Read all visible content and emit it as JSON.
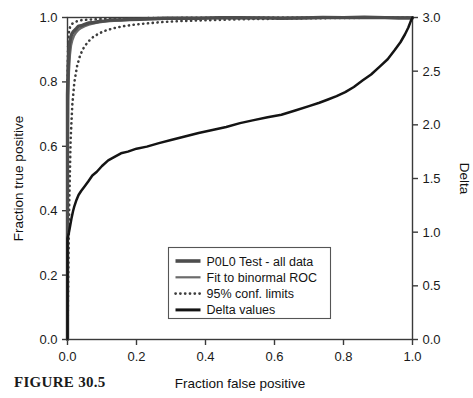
{
  "figure": {
    "caption": "FIGURE 30.5"
  },
  "chart_data": {
    "type": "line",
    "title": "",
    "xlabel": "Fraction false positive",
    "ylabel": "Fraction true positive",
    "y2label": "Delta",
    "xlim": [
      0.0,
      1.0
    ],
    "ylim": [
      0.0,
      1.0
    ],
    "y2lim": [
      0.0,
      3.0
    ],
    "grid": false,
    "legend_position": "lower center",
    "xticks": [
      "0.0",
      "0.2",
      "0.4",
      "0.6",
      "0.8",
      "1.0"
    ],
    "xtick_values": [
      0.0,
      0.2,
      0.4,
      0.6,
      0.8,
      1.0
    ],
    "yticks": [
      "0.0",
      "0.2",
      "0.4",
      "0.6",
      "0.8",
      "1.0"
    ],
    "ytick_values": [
      0.0,
      0.2,
      0.4,
      0.6,
      0.8,
      1.0
    ],
    "y2ticks": [
      "0.0",
      "0.5",
      "1.0",
      "1.5",
      "2.0",
      "2.5",
      "3.0"
    ],
    "y2tick_values": [
      0.0,
      0.5,
      1.0,
      1.5,
      2.0,
      2.5,
      3.0
    ],
    "colors": {
      "empirical_roc": "#4d4d4d",
      "binormal_fit": "#6b6b6b",
      "conf_limits": "#3d3d3d",
      "delta": "#141414",
      "axis": "#3a3a3a"
    },
    "series": [
      {
        "name": "P0L0 Test - all data",
        "style": "solid-thick",
        "axis": "left",
        "x": [
          0.0,
          0.0,
          0.0,
          0.0,
          0.002,
          0.004,
          0.006,
          0.009,
          0.012,
          0.016,
          0.021,
          0.026,
          0.032,
          0.04,
          0.05,
          0.062,
          0.076,
          0.092,
          0.11,
          0.13,
          0.155,
          0.18,
          0.21,
          0.245,
          0.285,
          0.33,
          0.38,
          0.44,
          0.5,
          0.56,
          0.62,
          0.68,
          0.74,
          0.8,
          0.86,
          0.92,
          0.96,
          1.0
        ],
        "y": [
          0.0,
          0.3,
          0.56,
          0.76,
          0.85,
          0.895,
          0.92,
          0.936,
          0.947,
          0.955,
          0.962,
          0.967,
          0.972,
          0.976,
          0.98,
          0.983,
          0.986,
          0.988,
          0.99,
          0.992,
          0.993,
          0.994,
          0.995,
          0.996,
          0.9965,
          0.997,
          0.9975,
          0.998,
          0.9982,
          0.9985,
          0.9988,
          0.999,
          0.9992,
          0.9994,
          0.9996,
          0.9998,
          0.9999,
          1.0
        ]
      },
      {
        "name": "Fit to binormal ROC",
        "style": "solid",
        "axis": "left",
        "x": [
          0.0,
          0.0,
          0.001,
          0.002,
          0.004,
          0.007,
          0.01,
          0.014,
          0.019,
          0.025,
          0.032,
          0.04,
          0.05,
          0.062,
          0.076,
          0.092,
          0.112,
          0.135,
          0.162,
          0.195,
          0.232,
          0.275,
          0.325,
          0.385,
          0.45,
          0.52,
          0.595,
          0.672,
          0.75,
          0.83,
          0.905,
          0.96,
          1.0
        ],
        "y": [
          0.0,
          0.32,
          0.6,
          0.74,
          0.83,
          0.885,
          0.912,
          0.93,
          0.944,
          0.954,
          0.962,
          0.968,
          0.973,
          0.978,
          0.982,
          0.985,
          0.988,
          0.99,
          0.992,
          0.994,
          0.995,
          0.996,
          0.997,
          0.9975,
          0.998,
          0.9985,
          0.999,
          0.9992,
          0.9995,
          0.9997,
          0.9998,
          0.9999,
          1.0
        ]
      },
      {
        "name": "95% conf. limits",
        "style": "dotted",
        "axis": "left",
        "lower": {
          "x": [
            0.0,
            0.002,
            0.005,
            0.009,
            0.014,
            0.02,
            0.028,
            0.037,
            0.048,
            0.06,
            0.075,
            0.092,
            0.112,
            0.135,
            0.162,
            0.195,
            0.232,
            0.275,
            0.325,
            0.385,
            0.45,
            0.52,
            0.6,
            0.69,
            0.79,
            0.89,
            1.0
          ],
          "y": [
            0.0,
            0.17,
            0.42,
            0.62,
            0.73,
            0.8,
            0.85,
            0.884,
            0.908,
            0.925,
            0.94,
            0.951,
            0.96,
            0.967,
            0.973,
            0.978,
            0.982,
            0.986,
            0.989,
            0.991,
            0.993,
            0.995,
            0.996,
            0.9975,
            0.9985,
            0.9993,
            1.0
          ]
        },
        "upper": {
          "x": [
            0.0,
            0.0,
            0.0,
            0.001,
            0.002,
            0.004,
            0.006,
            0.009,
            0.013,
            0.018,
            0.024,
            0.032,
            0.042,
            0.055,
            0.07,
            0.09,
            0.115,
            0.145,
            0.185,
            0.235,
            0.3,
            0.38,
            0.48,
            0.6,
            0.74,
            0.88,
            1.0
          ],
          "y": [
            0.0,
            0.52,
            0.76,
            0.87,
            0.925,
            0.952,
            0.966,
            0.974,
            0.98,
            0.984,
            0.987,
            0.99,
            0.992,
            0.993,
            0.994,
            0.995,
            0.996,
            0.9968,
            0.9975,
            0.998,
            0.9985,
            0.999,
            0.9993,
            0.9996,
            0.9998,
            0.9999,
            1.0
          ]
        }
      },
      {
        "name": "Delta values",
        "style": "solid-black",
        "axis": "right",
        "x": [
          0.0,
          0.0,
          0.004,
          0.008,
          0.012,
          0.016,
          0.02,
          0.026,
          0.032,
          0.04,
          0.05,
          0.06,
          0.072,
          0.085,
          0.1,
          0.118,
          0.135,
          0.155,
          0.175,
          0.2,
          0.23,
          0.265,
          0.3,
          0.34,
          0.38,
          0.42,
          0.46,
          0.5,
          0.54,
          0.58,
          0.62,
          0.66,
          0.7,
          0.73,
          0.755,
          0.78,
          0.805,
          0.83,
          0.855,
          0.88,
          0.905,
          0.928,
          0.948,
          0.965,
          0.978,
          0.988,
          0.995,
          1.0
        ],
        "y_left": [
          0.0,
          0.315,
          0.33,
          0.355,
          0.378,
          0.398,
          0.415,
          0.432,
          0.448,
          0.462,
          0.478,
          0.492,
          0.508,
          0.523,
          0.54,
          0.556,
          0.568,
          0.578,
          0.584,
          0.592,
          0.6,
          0.61,
          0.62,
          0.63,
          0.64,
          0.65,
          0.66,
          0.67,
          0.68,
          0.69,
          0.7,
          0.712,
          0.724,
          0.735,
          0.744,
          0.756,
          0.77,
          0.786,
          0.804,
          0.824,
          0.848,
          0.872,
          0.898,
          0.922,
          0.948,
          0.97,
          0.988,
          1.0
        ],
        "y_right": [
          0.0,
          0.945,
          0.99,
          1.065,
          1.134,
          1.194,
          1.245,
          1.296,
          1.344,
          1.386,
          1.434,
          1.476,
          1.524,
          1.569,
          1.62,
          1.668,
          1.704,
          1.734,
          1.752,
          1.776,
          1.8,
          1.83,
          1.86,
          1.89,
          1.92,
          1.95,
          1.98,
          2.01,
          2.04,
          2.07,
          2.1,
          2.136,
          2.172,
          2.205,
          2.232,
          2.268,
          2.31,
          2.358,
          2.412,
          2.472,
          2.544,
          2.616,
          2.694,
          2.766,
          2.844,
          2.91,
          2.964,
          3.0
        ]
      }
    ]
  },
  "legend": {
    "items": [
      {
        "label": "P0L0 Test - all data",
        "swatch": "solid-thick"
      },
      {
        "label": "Fit to binormal ROC",
        "swatch": "solid"
      },
      {
        "label": "95% conf. limits",
        "swatch": "dotted"
      },
      {
        "label": "Delta values",
        "swatch": "solid-black"
      }
    ]
  }
}
